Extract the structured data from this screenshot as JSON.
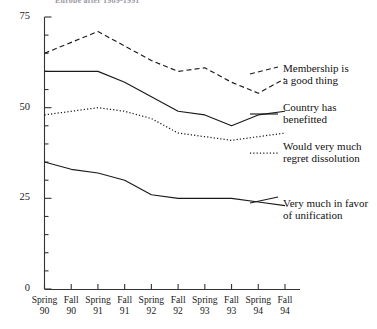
{
  "chart_data": {
    "type": "line",
    "title": "Europe after 1989-1991",
    "xlabel": "",
    "ylabel": "",
    "ylim": [
      0,
      75
    ],
    "yticks": [
      0,
      25,
      50,
      75
    ],
    "ytick_labels": [
      "0",
      "25",
      "50",
      "75"
    ],
    "minor_ticks": true,
    "grid": false,
    "legend_position": "right",
    "categories": [
      "Spring 90",
      "Fall 90",
      "Spring 91",
      "Fall 91",
      "Spring 92",
      "Fall 92",
      "Spring 93",
      "Fall 93",
      "Spring 94",
      "Fall 94"
    ],
    "x_seasons": [
      "Spring",
      "Fall",
      "Spring",
      "Fall",
      "Spring",
      "Fall",
      "Spring",
      "Fall",
      "Spring",
      "Fall"
    ],
    "x_years": [
      "90",
      "90",
      "91",
      "91",
      "92",
      "92",
      "93",
      "93",
      "94",
      "94"
    ],
    "series": [
      {
        "name": "Membership is a good thing",
        "style": "dashed",
        "color": "#1a1a1a",
        "values": [
          65,
          68,
          71,
          67,
          63,
          60,
          61,
          57,
          54,
          58
        ]
      },
      {
        "name": "Country has benefitted",
        "style": "solid",
        "color": "#1a1a1a",
        "values": [
          60,
          60,
          60,
          57,
          53,
          49,
          48,
          45,
          48,
          49
        ]
      },
      {
        "name": "Would very much regret dissolution",
        "style": "dotted",
        "color": "#1a1a1a",
        "values": [
          48,
          49,
          50,
          49,
          47,
          43,
          42,
          41,
          42,
          43
        ]
      },
      {
        "name": "Very much in favor of unification",
        "style": "solid",
        "color": "#1a1a1a",
        "values": [
          35,
          33,
          32,
          30,
          26,
          25,
          25,
          25,
          24,
          23
        ]
      }
    ]
  },
  "legend": {
    "entries": [
      {
        "label": "Membership is\na good thing",
        "style": "dashed"
      },
      {
        "label": "Country has\nbenefitted",
        "style": "solid"
      },
      {
        "label": "Would very much\nregret dissolution",
        "style": "dotted"
      },
      {
        "label": "Very much in favor\nof unification",
        "style": "solid"
      }
    ]
  }
}
